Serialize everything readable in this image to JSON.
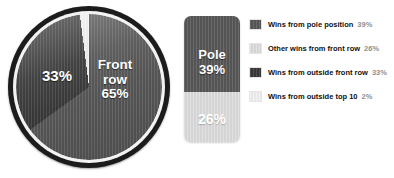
{
  "chart_data": {
    "type": "pie",
    "title": "",
    "subtitle": "",
    "xlabel": "",
    "ylabel": "",
    "legend_position": "right",
    "grid": false,
    "categories": [
      "Wins from pole position",
      "Other wins from front row",
      "Wins from outside front row",
      "Wins from outside top 10"
    ],
    "values": [
      39,
      26,
      33,
      2
    ],
    "units": "%",
    "colors": [
      "#585858",
      "#dedede",
      "#3a3a3a",
      "#f2f2f2"
    ],
    "annotations": [
      "33%",
      "Front row\n65%",
      "Pole\n39%",
      "26%"
    ],
    "groups": [
      {
        "name": "Front row",
        "value": 65,
        "members": [
          "Wins from pole position",
          "Other wins from front row"
        ]
      },
      {
        "name": "Wins from outside front row",
        "value": 33,
        "members": [
          "Wins from outside front row"
        ]
      },
      {
        "name": "Wins from outside top 10",
        "value": 2,
        "members": [
          "Wins from outside top 10"
        ]
      }
    ]
  },
  "pie": {
    "left_label": "33%",
    "right_label": "Front row\n65%"
  },
  "bar": {
    "top_label": "Pole\n39%",
    "bottom_label": "26%"
  },
  "legend": {
    "rows": [
      {
        "label": "Wins from pole position",
        "pct": "39%",
        "color": "#585858"
      },
      {
        "label": "Other wins from front row",
        "pct": "26%",
        "color": "#dedede"
      },
      {
        "label": "Wins from outside front row",
        "pct": "33%",
        "color": "#3a3a3a"
      },
      {
        "label": "Wins from outside top 10",
        "pct": "2%",
        "color": "#f2f2f2"
      }
    ]
  }
}
